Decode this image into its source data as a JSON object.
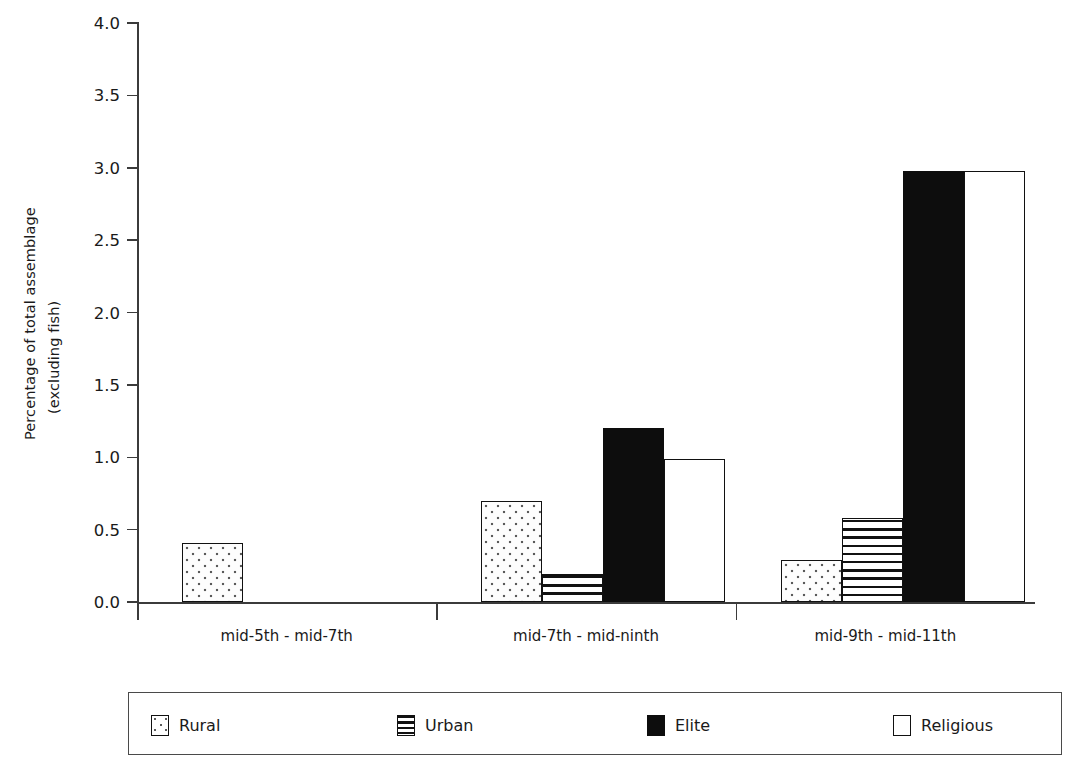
{
  "chart_data": {
    "type": "bar",
    "title": "",
    "xlabel": "",
    "ylabel_line1": "Percentage of total assemblage",
    "ylabel_line2": "(excluding fish)",
    "categories": [
      "mid-5th - mid-7th",
      "mid-7th - mid-ninth",
      "mid-9th - mid-11th"
    ],
    "series": [
      {
        "name": "Rural",
        "values": [
          0.41,
          0.7,
          0.29
        ]
      },
      {
        "name": "Urban",
        "values": [
          0.0,
          0.19,
          0.58
        ]
      },
      {
        "name": "Elite",
        "values": [
          0.0,
          1.2,
          2.98
        ]
      },
      {
        "name": "Religious",
        "values": [
          0.0,
          0.99,
          2.98
        ]
      }
    ],
    "ylim": [
      0.0,
      4.0
    ],
    "yticks": [
      "0.0",
      "0.5",
      "1.0",
      "1.5",
      "2.0",
      "2.5",
      "3.0",
      "3.5",
      "4.0"
    ],
    "ytick_values": [
      0.0,
      0.5,
      1.0,
      1.5,
      2.0,
      2.5,
      3.0,
      3.5,
      4.0
    ],
    "grid": false,
    "legend_position": "below-axes",
    "patterns": {
      "Rural": "dotted",
      "Urban": "horizontal-stripes",
      "Elite": "solid-black",
      "Religious": "white-open"
    },
    "colors": {
      "axis": "#3b3b3b",
      "bar_outline": "#111111",
      "elite_fill": "#0d0d0d",
      "religious_fill": "#ffffff",
      "text": "#1a1a1a",
      "background": "#ffffff"
    }
  },
  "legend": {
    "items": [
      {
        "label": "Rural"
      },
      {
        "label": "Urban"
      },
      {
        "label": "Elite"
      },
      {
        "label": "Religious"
      }
    ]
  }
}
